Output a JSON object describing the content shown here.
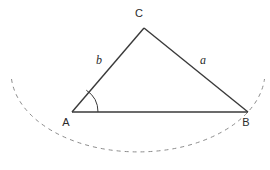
{
  "figure": {
    "background_color": "#ffffff",
    "line_color": "#3a3a3a",
    "arc_color": "#8c8c8c",
    "text_color": "#2b2b2b",
    "vertices": [
      {
        "name": "A",
        "label": "A",
        "x": 72,
        "y": 112,
        "label_x": 66,
        "label_y": 126
      },
      {
        "name": "B",
        "label": "B",
        "x": 248,
        "y": 112,
        "label_x": 243,
        "label_y": 126
      },
      {
        "name": "C",
        "label": "C",
        "x": 144,
        "y": 28,
        "label_x": 139,
        "label_y": 17
      }
    ],
    "sides": [
      {
        "name": "side-a",
        "label": "a",
        "from": "C",
        "to": "B",
        "label_x": 199,
        "label_y": 64
      },
      {
        "name": "side-b",
        "label": "b",
        "from": "A",
        "to": "C",
        "label_x": 90,
        "label_y": 64
      },
      {
        "name": "side-c",
        "label": "",
        "from": "A",
        "to": "B",
        "label_x": 0,
        "label_y": 0
      }
    ],
    "angle_marker": {
      "at_vertex": "A",
      "label": "",
      "radius": 26
    },
    "dashed_arc": {
      "center_x": 138,
      "center_y": 77,
      "radius_x": 127,
      "radius_y": 80,
      "dash_pattern": "4 4",
      "description": "dashed elliptical arc passing near B"
    }
  }
}
